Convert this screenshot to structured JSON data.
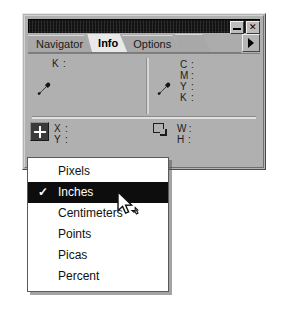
{
  "window": {
    "title": "",
    "buttons": [
      {
        "name": "minimize",
        "label": "",
        "icon": "minimize-icon"
      },
      {
        "name": "close",
        "label": "✕",
        "icon": "close-icon"
      }
    ]
  },
  "tabs": [
    {
      "label": "Navigator",
      "active": false
    },
    {
      "label": "Info",
      "active": true
    },
    {
      "label": "Options",
      "active": false
    }
  ],
  "palette_menu_button": {
    "icon": "triangle-right-icon",
    "label": "▶"
  },
  "info": {
    "first_color_readout": {
      "icon": "eyedropper-icon",
      "rows": [
        {
          "label": "K",
          "colon": ":",
          "value": ""
        }
      ]
    },
    "second_color_readout": {
      "icon": "eyedropper-icon",
      "rows": [
        {
          "label": "C",
          "colon": ":",
          "value": ""
        },
        {
          "label": "M",
          "colon": ":",
          "value": ""
        },
        {
          "label": "Y",
          "colon": ":",
          "value": ""
        },
        {
          "label": "K",
          "colon": ":",
          "value": ""
        }
      ]
    },
    "position_readout": {
      "icon": "crosshair-icon",
      "rows": [
        {
          "label": "X",
          "colon": ":",
          "value": ""
        },
        {
          "label": "Y",
          "colon": ":",
          "value": ""
        }
      ]
    },
    "size_readout": {
      "icon": "marquee-icon",
      "rows": [
        {
          "label": "W",
          "colon": ":",
          "value": ""
        },
        {
          "label": "H",
          "colon": ":",
          "value": ""
        }
      ]
    }
  },
  "units_menu": {
    "items": [
      {
        "label": "Pixels",
        "checked": false,
        "selected": false
      },
      {
        "label": "Inches",
        "checked": true,
        "selected": true
      },
      {
        "label": "Centimeters",
        "checked": false,
        "selected": false
      },
      {
        "label": "Points",
        "checked": false,
        "selected": false
      },
      {
        "label": "Picas",
        "checked": false,
        "selected": false
      },
      {
        "label": "Percent",
        "checked": false,
        "selected": false
      }
    ],
    "check_glyph": "✓"
  },
  "cursor": {
    "icon": "arrow-pointer-icon"
  },
  "colors": {
    "palette_face": "#b0b0b0",
    "titlebar": "#111111",
    "menu_background": "#ffffff",
    "menu_highlight": "#0d0d0d",
    "active_tab": "#e9e9e9"
  }
}
